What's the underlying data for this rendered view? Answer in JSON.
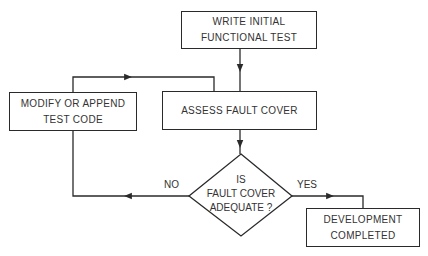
{
  "diagram": {
    "type": "flowchart",
    "nodes": {
      "write_test": {
        "lines": [
          "WRITE INITIAL",
          "FUNCTIONAL TEST"
        ]
      },
      "assess": {
        "lines": [
          "ASSESS FAULT COVER"
        ]
      },
      "modify": {
        "lines": [
          "MODIFY OR APPEND",
          "TEST CODE"
        ]
      },
      "decision": {
        "lines": [
          "IS",
          "FAULT COVER",
          "ADEQUATE ?"
        ]
      },
      "done": {
        "lines": [
          "DEVELOPMENT",
          "COMPLETED"
        ]
      }
    },
    "edges": {
      "no_label": "NO",
      "yes_label": "YES"
    },
    "colors": {
      "stroke": "#2a2a2a",
      "text": "#333333",
      "background": "#ffffff"
    }
  }
}
